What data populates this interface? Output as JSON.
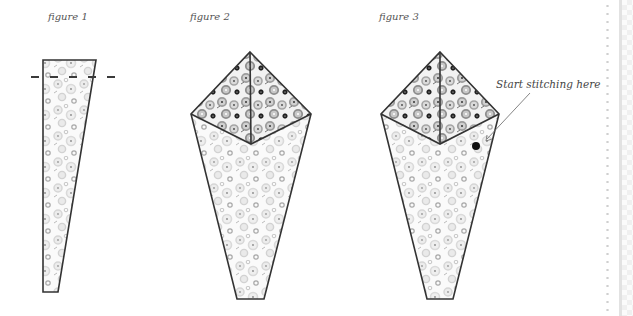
{
  "figures": [
    {
      "id": "figure-1",
      "caption": "figure 1"
    },
    {
      "id": "figure-2",
      "caption": "figure 2"
    },
    {
      "id": "figure-3",
      "caption": "figure 3",
      "annotation": "Start stitching here"
    }
  ],
  "colors": {
    "outline": "#333333",
    "fabric_light": "#e4e4e4",
    "fabric_dark": "#9a9a9a",
    "marker_dot": "#111111"
  }
}
